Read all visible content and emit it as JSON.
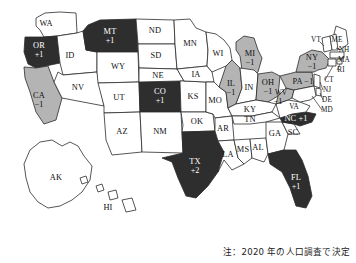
{
  "figure": {
    "caption": "注：2020 年の人口調査で決定",
    "colors": {
      "gain_fill": "#2e2e2e",
      "loss_fill": "#b4b4b4",
      "neutral_fill": "#ffffff",
      "outline": "#2b2b2b",
      "gain_label": "#ffffff",
      "loss_label": "#111111",
      "background": "#ffffff"
    }
  },
  "map_data": {
    "type": "choropleth",
    "title": "",
    "legend": [],
    "categories": [
      "gain",
      "loss",
      "none"
    ],
    "states": [
      {
        "code": "WA",
        "delta": "",
        "class": "none"
      },
      {
        "code": "OR",
        "delta": "+1",
        "class": "gain"
      },
      {
        "code": "CA",
        "delta": "−1",
        "class": "loss"
      },
      {
        "code": "ID",
        "delta": "",
        "class": "none"
      },
      {
        "code": "NV",
        "delta": "",
        "class": "none"
      },
      {
        "code": "MT",
        "delta": "+1",
        "class": "gain"
      },
      {
        "code": "WY",
        "delta": "",
        "class": "none"
      },
      {
        "code": "UT",
        "delta": "",
        "class": "none"
      },
      {
        "code": "AZ",
        "delta": "",
        "class": "none"
      },
      {
        "code": "CO",
        "delta": "+1",
        "class": "gain"
      },
      {
        "code": "NM",
        "delta": "",
        "class": "none"
      },
      {
        "code": "ND",
        "delta": "",
        "class": "none"
      },
      {
        "code": "SD",
        "delta": "",
        "class": "none"
      },
      {
        "code": "NE",
        "delta": "",
        "class": "none"
      },
      {
        "code": "KS",
        "delta": "",
        "class": "none"
      },
      {
        "code": "OK",
        "delta": "",
        "class": "none"
      },
      {
        "code": "TX",
        "delta": "+2",
        "class": "gain"
      },
      {
        "code": "MN",
        "delta": "",
        "class": "none"
      },
      {
        "code": "IA",
        "delta": "",
        "class": "none"
      },
      {
        "code": "MO",
        "delta": "",
        "class": "none"
      },
      {
        "code": "AR",
        "delta": "",
        "class": "none"
      },
      {
        "code": "LA",
        "delta": "",
        "class": "none"
      },
      {
        "code": "WI",
        "delta": "",
        "class": "none"
      },
      {
        "code": "IL",
        "delta": "−1",
        "class": "loss"
      },
      {
        "code": "MS",
        "delta": "",
        "class": "none"
      },
      {
        "code": "AL",
        "delta": "",
        "class": "none"
      },
      {
        "code": "MI",
        "delta": "−1",
        "class": "loss"
      },
      {
        "code": "IN",
        "delta": "",
        "class": "none"
      },
      {
        "code": "OH",
        "delta": "−1",
        "class": "loss"
      },
      {
        "code": "KY",
        "delta": "",
        "class": "none"
      },
      {
        "code": "TN",
        "delta": "",
        "class": "none"
      },
      {
        "code": "GA",
        "delta": "",
        "class": "none"
      },
      {
        "code": "FL",
        "delta": "+1",
        "class": "gain"
      },
      {
        "code": "SC",
        "delta": "",
        "class": "none"
      },
      {
        "code": "NC",
        "delta": "+1",
        "class": "gain"
      },
      {
        "code": "VA",
        "delta": "",
        "class": "none"
      },
      {
        "code": "WV",
        "delta": "−1",
        "class": "loss"
      },
      {
        "code": "PA",
        "delta": "−1",
        "class": "loss"
      },
      {
        "code": "NY",
        "delta": "−1",
        "class": "loss"
      },
      {
        "code": "VT",
        "delta": "",
        "class": "none"
      },
      {
        "code": "ME",
        "delta": "",
        "class": "none"
      },
      {
        "code": "NH",
        "delta": "",
        "class": "none"
      },
      {
        "code": "MA",
        "delta": "",
        "class": "none"
      },
      {
        "code": "RI",
        "delta": "",
        "class": "none"
      },
      {
        "code": "CT",
        "delta": "",
        "class": "none"
      },
      {
        "code": "NJ",
        "delta": "",
        "class": "none"
      },
      {
        "code": "DE",
        "delta": "",
        "class": "none"
      },
      {
        "code": "MD",
        "delta": "",
        "class": "none"
      },
      {
        "code": "AK",
        "delta": "",
        "class": "none"
      },
      {
        "code": "HI",
        "delta": "",
        "class": "none"
      }
    ],
    "labels": {
      "WA": "WA",
      "OR": "OR",
      "CA": "CA",
      "ID": "ID",
      "NV": "NV",
      "MT": "MT",
      "WY": "WY",
      "UT": "UT",
      "AZ": "AZ",
      "CO": "CO",
      "NM": "NM",
      "ND": "ND",
      "SD": "SD",
      "NE": "NE",
      "KS": "KS",
      "OK": "OK",
      "TX": "TX",
      "MN": "MN",
      "IA": "IA",
      "MO": "MO",
      "AR": "AR",
      "LA": "LA",
      "WI": "WI",
      "IL": "IL",
      "MS": "MS",
      "AL": "AL",
      "MI": "MI",
      "IN": "IN",
      "OH": "OH",
      "KY": "KY",
      "TN": "TN",
      "GA": "GA",
      "FL": "FL",
      "SC": "SC",
      "NC": "NC +1",
      "VA": "VA",
      "WV": "WV",
      "PA": "PA  −1",
      "NY": "NY",
      "VT": "VT",
      "ME": "ME",
      "NH": "NH",
      "MA": "MA",
      "RI": "RI",
      "CT": "CT",
      "NJ": "NJ",
      "DE": "DE",
      "MD": "MD",
      "AK": "AK",
      "HI": "HI"
    },
    "deltas": {
      "OR": "+1",
      "CA": "−1",
      "MT": "+1",
      "CO": "+1",
      "TX": "+2",
      "IL": "−1",
      "MI": "−1",
      "OH": "−1",
      "WV": "−1",
      "NY": "−1",
      "FL": "+1"
    }
  }
}
